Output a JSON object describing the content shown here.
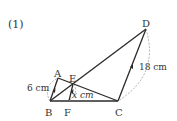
{
  "problem_label": "(1)",
  "points": {
    "A": {
      "label": "A",
      "x": 58,
      "y": 78
    },
    "B": {
      "label": "B",
      "x": 50,
      "y": 101
    },
    "C": {
      "label": "C",
      "x": 118,
      "y": 101
    },
    "D": {
      "label": "D",
      "x": 146,
      "y": 29
    },
    "E": {
      "label": "E",
      "x": 73,
      "y": 84
    },
    "F": {
      "label": "F",
      "x": 69,
      "y": 101
    }
  },
  "measurements": {
    "AB": "6 cm",
    "DC": "18 cm",
    "EF": "x cm"
  },
  "colors": {
    "line": "#2a2a2a",
    "dashed": "#9a9a9a",
    "text": "#333333"
  }
}
